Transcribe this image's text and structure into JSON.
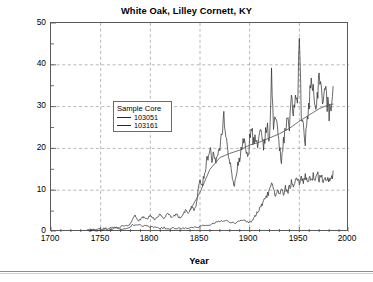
{
  "figure": {
    "title": "White Oak, Lilley Cornett, KY",
    "xlabel": "Year",
    "ylabel_main": "Basal Area Increment (cm",
    "ylabel_unit": "2",
    "ylabel_close": ")"
  },
  "legend": {
    "title": "Sample Core",
    "entries": [
      {
        "label": "103051",
        "color": "#2a2a2a"
      },
      {
        "label": "103161",
        "color": "#2a2a2a"
      }
    ]
  },
  "axes": {
    "x_ticks": [
      "1700",
      "1750",
      "1800",
      "1850",
      "1900",
      "1950",
      "2000"
    ],
    "y_ticks": [
      "50",
      "40",
      "30",
      "20",
      "10",
      "0"
    ]
  },
  "chart_data": {
    "type": "line",
    "title": "White Oak, Lilley Cornett, KY",
    "xlabel": "Year",
    "ylabel": "Basal Area Increment (cm2)",
    "xlim": [
      1700,
      2000
    ],
    "ylim": [
      0,
      50
    ],
    "x_major_ticks": [
      1700,
      1750,
      1800,
      1850,
      1900,
      1950,
      2000
    ],
    "x_minor_interval": 10,
    "y_major_ticks": [
      0,
      10,
      20,
      30,
      40,
      50
    ],
    "y_minor_interval": 5,
    "grid": "both-major-dashed",
    "legend_position": "inside-upper-left",
    "legend_title": "Sample Core",
    "series": [
      {
        "name": "103051",
        "color": "#2a2a2a",
        "note": "Upper, highly variable ring series; peak 45.5 cm2 near 1950",
        "x": [
          1737,
          1740,
          1743,
          1746,
          1749,
          1752,
          1755,
          1758,
          1761,
          1764,
          1767,
          1770,
          1773,
          1776,
          1779,
          1782,
          1784,
          1786,
          1788,
          1790,
          1792,
          1794,
          1796,
          1798,
          1800,
          1802,
          1804,
          1806,
          1808,
          1810,
          1812,
          1814,
          1816,
          1818,
          1820,
          1822,
          1824,
          1826,
          1828,
          1830,
          1832,
          1834,
          1836,
          1838,
          1840,
          1842,
          1844,
          1846,
          1848,
          1850,
          1852,
          1854,
          1856,
          1858,
          1860,
          1862,
          1864,
          1866,
          1868,
          1870,
          1872,
          1874,
          1876,
          1878,
          1880,
          1882,
          1884,
          1886,
          1888,
          1890,
          1892,
          1894,
          1896,
          1898,
          1900,
          1902,
          1904,
          1906,
          1908,
          1910,
          1912,
          1914,
          1916,
          1918,
          1920,
          1922,
          1924,
          1926,
          1928,
          1930,
          1932,
          1934,
          1936,
          1938,
          1940,
          1942,
          1944,
          1946,
          1948,
          1950,
          1952,
          1954,
          1956,
          1958,
          1960,
          1962,
          1964,
          1966,
          1968,
          1970,
          1972,
          1974,
          1976,
          1978,
          1980,
          1982,
          1984
        ],
        "y": [
          0.4,
          0.5,
          0.6,
          0.6,
          0.7,
          0.8,
          0.9,
          0.9,
          1.0,
          1.1,
          1.2,
          1.3,
          1.3,
          1.5,
          1.7,
          2.8,
          4.0,
          3.4,
          2.6,
          3.0,
          3.4,
          3.7,
          3.1,
          3.5,
          4.0,
          3.5,
          3.0,
          3.4,
          3.8,
          4.3,
          3.7,
          3.2,
          4.0,
          4.6,
          3.9,
          3.3,
          3.8,
          4.4,
          3.8,
          3.3,
          4.1,
          4.8,
          5.2,
          4.6,
          5.3,
          6.0,
          5.4,
          6.4,
          9.5,
          13.2,
          11.0,
          13.5,
          15.8,
          18.5,
          20.1,
          17.0,
          19.5,
          17.2,
          19.8,
          21.0,
          24.2,
          27.8,
          23.0,
          19.5,
          16.5,
          14.0,
          11.2,
          13.0,
          15.8,
          18.0,
          20.5,
          22.5,
          19.5,
          17.5,
          22.0,
          24.5,
          21.5,
          23.0,
          20.5,
          22.5,
          24.0,
          21.0,
          23.5,
          25.0,
          22.0,
          37.2,
          26.5,
          29.0,
          23.5,
          20.0,
          17.5,
          21.5,
          24.5,
          27.0,
          24.0,
          31.5,
          28.5,
          33.5,
          30.0,
          45.5,
          28.0,
          25.0,
          22.0,
          26.5,
          30.5,
          36.8,
          33.0,
          29.5,
          31.5,
          39.6,
          33.5,
          30.5,
          34.5,
          31.0,
          28.5,
          31.0,
          34.8
        ]
      },
      {
        "name": "103051-trend",
        "color": "#5a5a5a",
        "note": "Smoothed spline trend overlay on series 103051",
        "x": [
          1840,
          1850,
          1860,
          1870,
          1880,
          1890,
          1900,
          1910,
          1920,
          1930,
          1940,
          1950,
          1960,
          1970,
          1980,
          1984
        ],
        "y": [
          5.2,
          9.5,
          15.0,
          17.8,
          18.8,
          19.6,
          20.8,
          21.5,
          22.5,
          23.5,
          24.8,
          26.5,
          28.0,
          29.5,
          30.5,
          30.6
        ]
      },
      {
        "name": "103161",
        "color": "#2a2a2a",
        "note": "Lower series; slow growth, rises after 1900 to about 13-14 cm2",
        "x": [
          1737,
          1742,
          1747,
          1752,
          1757,
          1762,
          1767,
          1772,
          1777,
          1782,
          1786,
          1790,
          1794,
          1798,
          1802,
          1806,
          1810,
          1814,
          1818,
          1822,
          1826,
          1830,
          1834,
          1838,
          1842,
          1846,
          1850,
          1854,
          1858,
          1862,
          1866,
          1870,
          1874,
          1878,
          1882,
          1886,
          1890,
          1894,
          1898,
          1900,
          1902,
          1904,
          1906,
          1908,
          1910,
          1912,
          1914,
          1916,
          1918,
          1920,
          1922,
          1924,
          1926,
          1928,
          1930,
          1932,
          1934,
          1936,
          1938,
          1940,
          1942,
          1944,
          1946,
          1948,
          1950,
          1952,
          1954,
          1956,
          1958,
          1960,
          1962,
          1964,
          1966,
          1968,
          1970,
          1972,
          1974,
          1976,
          1978,
          1980,
          1982,
          1984
        ],
        "y": [
          0.3,
          0.4,
          0.5,
          0.5,
          0.6,
          0.7,
          0.8,
          0.9,
          1.0,
          1.6,
          1.8,
          1.5,
          1.4,
          1.3,
          1.2,
          1.1,
          1.0,
          1.0,
          0.9,
          0.9,
          0.9,
          0.9,
          1.0,
          1.0,
          1.1,
          1.2,
          1.3,
          1.4,
          1.6,
          1.9,
          2.2,
          2.6,
          2.8,
          2.6,
          2.4,
          2.2,
          2.5,
          2.8,
          2.4,
          2.3,
          2.6,
          3.2,
          4.0,
          4.8,
          5.6,
          6.5,
          7.4,
          8.2,
          9.0,
          10.0,
          11.3,
          10.0,
          8.8,
          9.6,
          9.0,
          9.8,
          9.2,
          10.5,
          9.5,
          10.8,
          11.8,
          10.5,
          11.8,
          12.6,
          11.6,
          13.2,
          12.0,
          13.6,
          12.4,
          13.0,
          12.2,
          13.4,
          12.6,
          13.8,
          12.8,
          13.0,
          12.2,
          13.2,
          12.4,
          13.0,
          12.0,
          14.6
        ]
      }
    ]
  }
}
